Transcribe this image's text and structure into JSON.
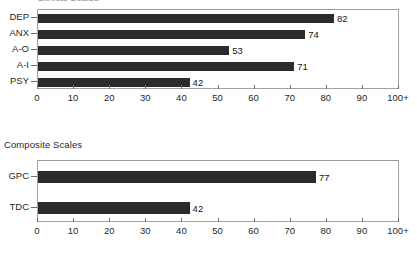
{
  "document": {
    "clipped_top_title": "Clinical Scales"
  },
  "charts": [
    {
      "id": "clinical-scales",
      "heading": "",
      "heading_visible": false,
      "bar_thickness_px": 9,
      "plot": {
        "top": 9,
        "height": 80
      },
      "heading_top": 0
    },
    {
      "id": "composite-scales",
      "heading": "Composite Scales",
      "heading_visible": true,
      "bar_thickness_px": 12,
      "plot": {
        "top": 160,
        "height": 62
      },
      "heading_top": 139
    }
  ],
  "axis": {
    "ticks": [
      "0",
      "10",
      "20",
      "30",
      "40",
      "50",
      "60",
      "70",
      "80",
      "90",
      "100+"
    ],
    "min": 0,
    "max": 100
  },
  "colors": {
    "bar": "#2b2b2b",
    "frame": "#a2a2a2",
    "text": "#1f1f1f"
  },
  "chart_data": [
    {
      "type": "bar",
      "orientation": "horizontal",
      "title": "Clinical Scales",
      "title_clipped": true,
      "categories": [
        "DEP",
        "ANX",
        "A-O",
        "A-I",
        "PSY"
      ],
      "values": [
        82,
        74,
        53,
        71,
        42
      ],
      "data_labels": [
        "82",
        "74",
        "53",
        "71",
        "42"
      ],
      "xlabel": "",
      "ylabel": "",
      "xlim": [
        0,
        100
      ],
      "xticks": [
        0,
        10,
        20,
        30,
        40,
        50,
        60,
        70,
        80,
        90,
        100
      ],
      "xticklabels": [
        "0",
        "10",
        "20",
        "30",
        "40",
        "50",
        "60",
        "70",
        "80",
        "90",
        "100+"
      ],
      "grid": false,
      "legend": false,
      "bar_color": "#2b2b2b"
    },
    {
      "type": "bar",
      "orientation": "horizontal",
      "title": "Composite Scales",
      "title_clipped": false,
      "categories": [
        "GPC",
        "TDC"
      ],
      "values": [
        77,
        42
      ],
      "data_labels": [
        "77",
        "42"
      ],
      "xlabel": "",
      "ylabel": "",
      "xlim": [
        0,
        100
      ],
      "xticks": [
        0,
        10,
        20,
        30,
        40,
        50,
        60,
        70,
        80,
        90,
        100
      ],
      "xticklabels": [
        "0",
        "10",
        "20",
        "30",
        "40",
        "50",
        "60",
        "70",
        "80",
        "90",
        "100+"
      ],
      "grid": false,
      "legend": false,
      "bar_color": "#2b2b2b"
    }
  ]
}
